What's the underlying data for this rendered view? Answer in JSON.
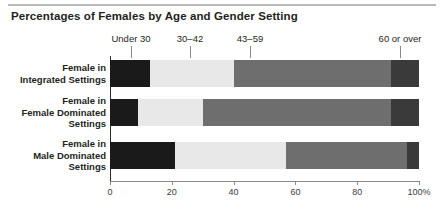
{
  "chart_data": {
    "type": "bar",
    "orientation": "horizontal",
    "stacked": true,
    "title": "Percentages of Females by Age and Gender Setting",
    "xlabel": "",
    "ylabel": "",
    "xlim": [
      0,
      100
    ],
    "grid": false,
    "legend_position": "top",
    "categories": [
      "Female in Integrated Settings",
      "Female in Female Dominated Settings",
      "Female in Male Dominated Settings"
    ],
    "series": [
      {
        "name": "Under 30",
        "color": "#1a1a1a",
        "values": [
          13,
          9,
          21
        ]
      },
      {
        "name": "30–42",
        "color": "#e8e8e8",
        "values": [
          27,
          21,
          36
        ]
      },
      {
        "name": "43–59",
        "color": "#6e6e6e",
        "values": [
          51,
          61,
          39
        ]
      },
      {
        "name": "60 or over",
        "color": "#3a3a3a",
        "values": [
          9,
          9,
          4
        ]
      }
    ],
    "xticks": [
      0,
      20,
      40,
      60,
      80,
      100
    ],
    "xticklabels": [
      "0",
      "20",
      "40",
      "60",
      "80",
      "100%"
    ]
  },
  "category_lines": [
    [
      "Female in",
      "Integrated Settings"
    ],
    [
      "Female in",
      "Female Dominated",
      "Settings"
    ],
    [
      "Female in",
      "Male Dominated",
      "Settings"
    ]
  ]
}
